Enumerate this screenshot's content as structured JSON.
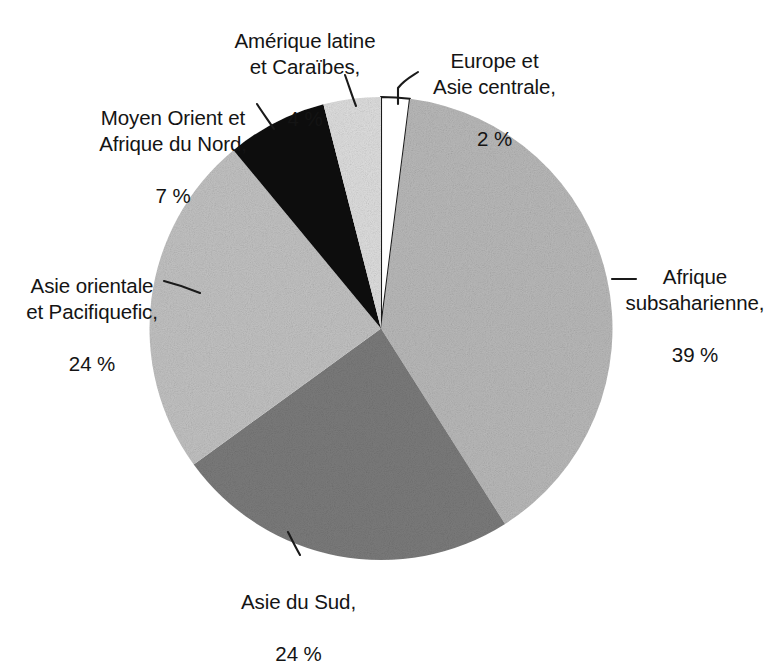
{
  "chart_data": {
    "type": "pie",
    "title": "",
    "subtitle": "",
    "xlabel": "",
    "ylabel": "",
    "legend_position": "none",
    "grid": false,
    "value_suffix": "%",
    "start_angle_deg": -90,
    "direction": "clockwise",
    "categories": [
      "Europe et Asie centrale",
      "Afrique subsaharienne",
      "Asie du Sud",
      "Asie orientale et Pacifiquefic",
      "Moyen Orient et Afrique du Nord",
      "Amérique latine et Caraïbes"
    ],
    "values": [
      2,
      39,
      24,
      24,
      7,
      4
    ],
    "slices": [
      {
        "id": "europe",
        "name": "Europe et Asie centrale",
        "value": 2,
        "value_text": "2 %",
        "color": "#ffffff",
        "stroke": "#1a1a1a"
      },
      {
        "id": "afrique-subsaharienne",
        "name": "Afrique subsaharienne",
        "value": 39,
        "value_text": "39 %",
        "color": "#b9b9b9",
        "stroke": "none"
      },
      {
        "id": "asie-du-sud",
        "name": "Asie du Sud",
        "value": 24,
        "value_text": "24 %",
        "color": "#7b7b7b",
        "stroke": "none"
      },
      {
        "id": "asie-orientale",
        "name": "Asie orientale et Pacifiquefic",
        "value": 24,
        "value_text": "24 %",
        "color": "#c2c2c2",
        "stroke": "none"
      },
      {
        "id": "moyen-orient",
        "name": "Moyen Orient et Afrique du Nord",
        "value": 7,
        "value_text": "7 %",
        "color": "#101010",
        "stroke": "none"
      },
      {
        "id": "amerique-latine",
        "name": "Amérique latine et Caraïbes",
        "value": 4,
        "value_text": "4 %",
        "color": "#dedede",
        "stroke": "none"
      }
    ]
  },
  "labels": {
    "amerique_latine": {
      "name": "Amérique latine\net Caraïbes,",
      "value": "4 %"
    },
    "europe": {
      "name": "Europe et\nAsie centrale,",
      "value": "2 %"
    },
    "moyen_orient": {
      "name": "Moyen Orient et\nAfrique du Nord,",
      "value": "7 %"
    },
    "asie_orientale": {
      "name": "Asie orientale\net Pacifiquefic,",
      "value": "24 %"
    },
    "afrique_subsaharienne": {
      "name": "Afrique\nsubsaharienne,",
      "value": "39 %"
    },
    "asie_du_sud": {
      "name": "Asie du Sud,",
      "value": "24 %"
    }
  },
  "colors": {
    "background": "#ffffff",
    "text": "#141414",
    "outline": "#1a1a1a",
    "light_gray": "#b9b9b9",
    "pale_gray": "#c2c2c2",
    "very_light_gray": "#dedede",
    "dark_gray": "#7b7b7b",
    "black": "#101010"
  }
}
